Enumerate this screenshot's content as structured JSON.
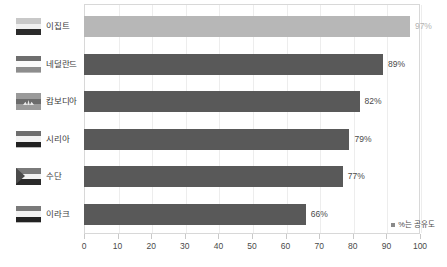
{
  "chart_data": {
    "type": "bar",
    "orientation": "horizontal",
    "title": "",
    "xlabel": "",
    "ylabel": "",
    "xlim": [
      0,
      100
    ],
    "xticks": [
      "0",
      "10",
      "20",
      "30",
      "40",
      "50",
      "60",
      "70",
      "80",
      "90",
      "100"
    ],
    "grid": true,
    "legend_position": "bottom-right",
    "legend": "%는 공유도",
    "categories": [
      "이집트",
      "네덜란드",
      "캄보디아",
      "시리아",
      "수단",
      "이라크"
    ],
    "values": [
      97,
      89,
      82,
      79,
      77,
      66
    ],
    "value_labels": [
      "97%",
      "89%",
      "82%",
      "79%",
      "77%",
      "66%"
    ],
    "colors": [
      "#b7b7b7",
      "#595959",
      "#595959",
      "#595959",
      "#595959",
      "#595959"
    ],
    "highlight_index": 0
  },
  "rows": [
    {
      "label": "이집트",
      "value": 97,
      "value_label": "97%",
      "flag_name": "flag-egypt",
      "flag_stripes": [
        "#c8c8c8",
        "#f0f0f0",
        "#2b2b2b"
      ],
      "highlight": true
    },
    {
      "label": "네덜란드",
      "value": 89,
      "value_label": "89%",
      "flag_name": "flag-netherlands",
      "flag_stripes": [
        "#6e6e6e",
        "#fafafa",
        "#8d8d8d"
      ],
      "highlight": false
    },
    {
      "label": "캄보디아",
      "value": 82,
      "value_label": "82%",
      "flag_name": "flag-cambodia",
      "flag_stripes": [
        "#9a9a9a",
        "#6b6b6b",
        "#9a9a9a"
      ],
      "highlight": false
    },
    {
      "label": "시리아",
      "value": 79,
      "value_label": "79%",
      "flag_name": "flag-syria",
      "flag_stripes": [
        "#6e6e6e",
        "#f2f2f2",
        "#222222"
      ],
      "highlight": false
    },
    {
      "label": "수단",
      "value": 77,
      "value_label": "77%",
      "flag_name": "flag-sudan",
      "flag_stripes": [
        "#7a7a7a",
        "#f2f2f2",
        "#2a2a2a"
      ],
      "highlight": false
    },
    {
      "label": "이라크",
      "value": 66,
      "value_label": "66%",
      "flag_name": "flag-iraq",
      "flag_stripes": [
        "#7a7a7a",
        "#f2f2f2",
        "#222222"
      ],
      "highlight": false
    }
  ],
  "legend": {
    "swatch_color": "#8a8a8a",
    "text": "%는 공유도"
  },
  "axis": {
    "ticks": [
      "0",
      "10",
      "20",
      "30",
      "40",
      "50",
      "60",
      "70",
      "80",
      "90",
      "100"
    ]
  }
}
